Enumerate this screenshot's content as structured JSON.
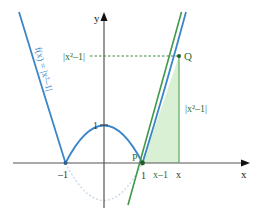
{
  "diagram": {
    "function_label": "f(x) = |x²–1|",
    "axes": {
      "x_label": "x",
      "y_label": "y"
    },
    "tick_labels": {
      "x_neg1": "–1",
      "x_pos1": "1",
      "y_pos1": "1",
      "x_var": "x"
    },
    "points": {
      "P": "P",
      "Q": "Q"
    },
    "segment_labels": {
      "horizontal": "x–1",
      "vertical": "|x²–1|",
      "dashed_y": "|x²–1|"
    },
    "colors": {
      "curve": "#3a86c8",
      "reflected_curve": "#c9d9ea",
      "tangent": "#3f9a4a",
      "triangle_fill": "#d9f0d4",
      "triangle_edge": "#5aa65e",
      "axis": "#555555",
      "label_green": "#3f8a3f"
    }
  }
}
